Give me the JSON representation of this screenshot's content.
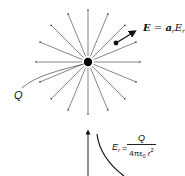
{
  "diagram": {
    "charge": {
      "label": "Q",
      "center": [
        88,
        62
      ],
      "radius": 4
    },
    "field_lines": {
      "count": 16,
      "length": 52,
      "description": "Radial field lines pointing outward from the charge"
    },
    "field_vector": {
      "label_bold": "E",
      "label_eq": " = ",
      "label_unit_vector": "a",
      "label_unit_sub": "r",
      "label_component": "E",
      "label_component_sub": "r",
      "full_text": "E = a_r E_r"
    },
    "graph": {
      "axis": "vertical arrow (E_r axis)",
      "curve": "inverse-square decay",
      "formula": {
        "lhs": "E",
        "lhs_sub": "r",
        "eq": "=",
        "numerator": "Q",
        "denominator": "4πε",
        "denominator_sub": "0",
        "denominator_tail": " r",
        "denominator_sup": "2",
        "full_text": "E_r = Q / (4πε0 r^2)"
      }
    }
  }
}
